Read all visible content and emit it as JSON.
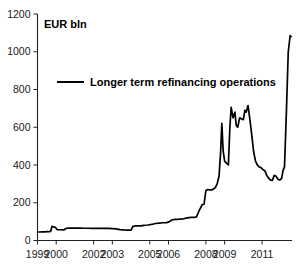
{
  "chart_data": {
    "type": "line",
    "title": "",
    "subtitle": "",
    "unit_label": "EUR bln",
    "xlabel": "",
    "ylabel": "EUR bln",
    "ylim": [
      0,
      1200
    ],
    "y_ticks": [
      0,
      200,
      400,
      600,
      800,
      1000,
      1200
    ],
    "y_tick_labels": [
      "0",
      "200",
      "400",
      "600",
      "800",
      "1000",
      "1200"
    ],
    "xlim": [
      1999.0,
      2012.6
    ],
    "x_ticks": [
      1999,
      2000,
      2002,
      2003,
      2005,
      2006,
      2008,
      2009,
      2011
    ],
    "x_tick_labels": [
      "1999",
      "2000",
      "2002",
      "2003",
      "2005",
      "2006",
      "2008",
      "2009",
      "2011"
    ],
    "grid": false,
    "legend_position": "inside-top-left",
    "legend": [
      "Longer term refinancing operations"
    ],
    "series": [
      {
        "name": "Longer term refinancing operations",
        "color": "#000000",
        "x": [
          1999.0,
          1999.1,
          1999.25,
          1999.4,
          1999.5,
          1999.6,
          1999.7,
          1999.78,
          1999.85,
          1999.95,
          2000.05,
          2000.15,
          2000.25,
          2000.4,
          2000.55,
          2000.7,
          2000.85,
          2001.0,
          2001.15,
          2001.3,
          2001.45,
          2001.6,
          2001.75,
          2001.9,
          2002.05,
          2002.2,
          2002.4,
          2002.6,
          2002.8,
          2003.0,
          2003.2,
          2003.4,
          2003.6,
          2003.8,
          2004.0,
          2004.1,
          2004.2,
          2004.35,
          2004.5,
          2004.7,
          2004.9,
          2005.1,
          2005.3,
          2005.5,
          2005.7,
          2005.9,
          2006.05,
          2006.2,
          2006.4,
          2006.6,
          2006.8,
          2007.0,
          2007.2,
          2007.35,
          2007.5,
          2007.6,
          2007.7,
          2007.8,
          2007.9,
          2008.0,
          2008.1,
          2008.2,
          2008.3,
          2008.4,
          2008.5,
          2008.6,
          2008.7,
          2008.78,
          2008.85,
          2008.92,
          2009.0,
          2009.05,
          2009.12,
          2009.2,
          2009.28,
          2009.35,
          2009.45,
          2009.55,
          2009.62,
          2009.7,
          2009.8,
          2009.9,
          2010.0,
          2010.08,
          2010.15,
          2010.25,
          2010.35,
          2010.45,
          2010.55,
          2010.65,
          2010.75,
          2010.85,
          2010.95,
          2011.05,
          2011.15,
          2011.25,
          2011.35,
          2011.45,
          2011.55,
          2011.65,
          2011.75,
          2011.85,
          2011.95,
          2012.05,
          2012.12,
          2012.2,
          2012.3,
          2012.4,
          2012.5,
          2012.55
        ],
        "y": [
          45,
          45,
          46,
          46,
          47,
          47,
          48,
          75,
          72,
          70,
          58,
          57,
          57,
          56,
          65,
          66,
          66,
          66,
          66,
          66,
          65,
          65,
          65,
          64,
          64,
          64,
          64,
          64,
          64,
          63,
          62,
          58,
          56,
          55,
          55,
          75,
          77,
          77,
          78,
          80,
          82,
          85,
          90,
          92,
          94,
          95,
          100,
          110,
          112,
          113,
          115,
          120,
          122,
          122,
          125,
          150,
          170,
          190,
          192,
          265,
          270,
          268,
          268,
          272,
          280,
          300,
          340,
          460,
          620,
          475,
          420,
          415,
          408,
          400,
          600,
          705,
          650,
          680,
          610,
          600,
          650,
          645,
          640,
          690,
          680,
          715,
          640,
          560,
          470,
          420,
          400,
          390,
          385,
          375,
          370,
          345,
          330,
          320,
          318,
          345,
          340,
          325,
          320,
          330,
          370,
          390,
          680,
          1000,
          1085,
          1080
        ]
      }
    ],
    "annotations": []
  },
  "legend_entry": {
    "label": "Longer term refinancing operations"
  },
  "axes": {
    "unit_label": "EUR bln"
  }
}
